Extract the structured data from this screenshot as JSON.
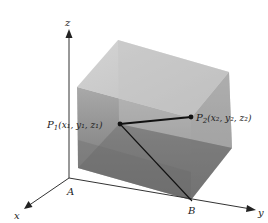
{
  "figure": {
    "axes": {
      "x_label": "x",
      "y_label": "y",
      "z_label": "z"
    },
    "points": {
      "p1": {
        "name": "P",
        "sub": "1",
        "coords": "(x₁, y₁, z₁)"
      },
      "p2": {
        "name": "P",
        "sub": "2",
        "coords": "(x₂, y₂, z₂)"
      },
      "a": "A",
      "b": "B"
    },
    "colors": {
      "box_top": "#c9c9c9",
      "box_front": "#8e8e8e",
      "box_side": "#a5a5a5",
      "box_shadow": "#6f6f6f",
      "line": "#111111"
    }
  }
}
